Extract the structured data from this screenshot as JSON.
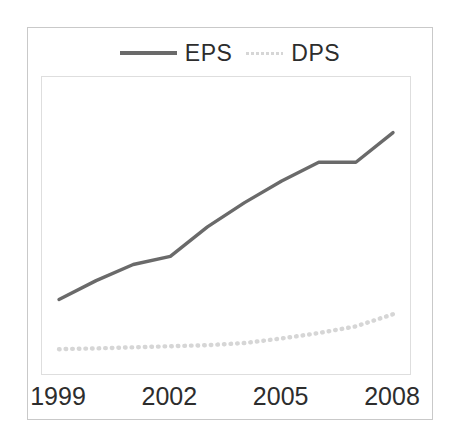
{
  "chart_data": {
    "type": "line",
    "title": "",
    "subtitle": "",
    "xlabel": "",
    "ylabel": "",
    "grid": false,
    "legend_position": "top-center",
    "x": [
      1999,
      2000,
      2001,
      2002,
      2003,
      2004,
      2005,
      2006,
      2007,
      2008
    ],
    "xlim": [
      1999,
      2008
    ],
    "ylim": [
      0,
      10
    ],
    "xticks": [
      "1999",
      "2002",
      "2005",
      "2008"
    ],
    "xtick_values": [
      1999,
      2002,
      2005,
      2008
    ],
    "series": [
      {
        "name": "EPS",
        "style": "solid",
        "color": "#6a6a6a",
        "values": [
          2.4,
          3.1,
          3.7,
          4.0,
          5.1,
          6.0,
          6.8,
          7.5,
          7.5,
          8.6
        ]
      },
      {
        "name": "DPS",
        "style": "dotted",
        "color": "#d6d6d6",
        "values": [
          0.55,
          0.58,
          0.62,
          0.66,
          0.7,
          0.78,
          0.95,
          1.15,
          1.4,
          1.85
        ]
      }
    ]
  },
  "legend": {
    "items": [
      {
        "label": "EPS",
        "swatch": "solid-line-swatch"
      },
      {
        "label": "DPS",
        "swatch": "dotted-line-swatch"
      }
    ]
  },
  "axis": {
    "x_tick_labels": [
      "1999",
      "2002",
      "2005",
      "2008"
    ]
  },
  "colors": {
    "eps_line": "#6a6a6a",
    "dps_line": "#d6d6d6",
    "outer_frame": "#c9c9c9",
    "plot_border": "#dedede",
    "text": "#2d2d2d",
    "background": "#ffffff"
  }
}
